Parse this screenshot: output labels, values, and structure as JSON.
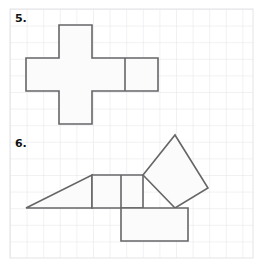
{
  "page": {
    "background_color": "#ffffff",
    "width": 264,
    "height": 268
  },
  "grid": {
    "line_color": "#e3e3e6",
    "cell_size": 16.6,
    "origin_x": 10,
    "origin_y": 9,
    "cols": 14.6,
    "rows": 15
  },
  "style": {
    "shape_stroke_color": "#666668",
    "shape_fill_color": "#fbfbfb",
    "shape_stroke_width": 1.6
  },
  "problems": [
    {
      "number": "5.",
      "name": "cross-net-figure",
      "description": "Plus-shaped net of squares with an extra square on the right arm",
      "shapes": [
        {
          "name": "cross-outline",
          "type": "polygon",
          "points": "59,25 92,25 92,58 158,58 158,91 92,91 92,124 59,124 59,91 26,91 26,58 59,58"
        },
        {
          "name": "divider-right-vertical",
          "type": "line",
          "points": "125,58 125,91"
        }
      ]
    },
    {
      "number": "6.",
      "name": "composite-figure",
      "description": "Triangle, rectangle, tilted square and bottom square composite",
      "shapes": [
        {
          "name": "left-triangle",
          "type": "polygon",
          "points": "26,208 92,175 92,208"
        },
        {
          "name": "middle-rectangle",
          "type": "polygon",
          "points": "92,175 143,175 143,208 92,208"
        },
        {
          "name": "tilted-square",
          "type": "polygon",
          "points": "143,175 175,135 208,188 175,208"
        },
        {
          "name": "bottom-square",
          "type": "polygon",
          "points": "121,208 188,208 188,241 121,241"
        },
        {
          "name": "inner-vertical-divider",
          "type": "line",
          "points": "121,175 121,208"
        }
      ]
    }
  ]
}
